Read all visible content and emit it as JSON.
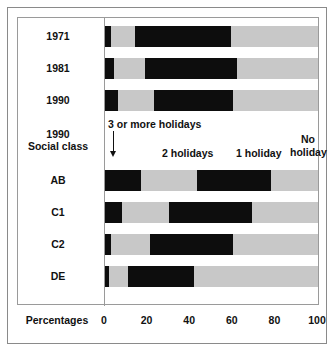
{
  "axis": {
    "caption": "Percentages",
    "ticks": [
      0,
      20,
      40,
      60,
      80,
      100
    ],
    "min": 0,
    "max": 100
  },
  "annotations": {
    "three_or_more": "3 or more holidays",
    "two": "2 holidays",
    "one": "1 holiday",
    "none": "No\nholiday",
    "none_line1": "No",
    "none_line2": "holiday"
  },
  "group_label": {
    "line1": "1990",
    "line2": "Social class"
  },
  "rows": [
    {
      "label": "1971",
      "label2": ""
    },
    {
      "label": "1981",
      "label2": ""
    },
    {
      "label": "1990",
      "label2": ""
    },
    {
      "label": "AB",
      "label2": ""
    },
    {
      "label": "C1",
      "label2": ""
    },
    {
      "label": "C2",
      "label2": ""
    },
    {
      "label": "DE",
      "label2": ""
    }
  ],
  "colors": {
    "dark": "#0d0d0d",
    "light": "#c8c8c8",
    "frame": "#8a8a8a",
    "background": "#ffffff"
  },
  "chart_data": {
    "type": "bar",
    "orientation": "horizontal",
    "stacked": true,
    "title": "",
    "xlabel": "Percentages",
    "ylabel": "",
    "xlim": [
      0,
      100
    ],
    "xticks": [
      0,
      20,
      40,
      60,
      80,
      100
    ],
    "grid": false,
    "legend_position": "inline-annotations",
    "categories": [
      "1971",
      "1981",
      "1990",
      "AB",
      "C1",
      "C2",
      "DE"
    ],
    "series": [
      {
        "name": "3 or more holidays",
        "color": "#0d0d0d",
        "values": [
          3,
          4,
          6,
          17,
          8,
          3,
          2
        ]
      },
      {
        "name": "2 holidays",
        "color": "#c8c8c8",
        "values": [
          11,
          15,
          17,
          26,
          22,
          18,
          9
        ]
      },
      {
        "name": "1 holiday",
        "color": "#0d0d0d",
        "values": [
          45,
          43,
          37,
          35,
          39,
          39,
          31
        ]
      },
      {
        "name": "No holiday",
        "color": "#c8c8c8",
        "values": [
          41,
          38,
          40,
          22,
          31,
          40,
          58
        ]
      }
    ],
    "annotations": [
      {
        "text": "3 or more holidays",
        "points_to_series": "3 or more holidays"
      },
      {
        "text": "2 holidays",
        "points_to_series": "2 holidays"
      },
      {
        "text": "1 holiday",
        "points_to_series": "1 holiday"
      },
      {
        "text": "No holiday",
        "points_to_series": "No holiday"
      }
    ]
  }
}
